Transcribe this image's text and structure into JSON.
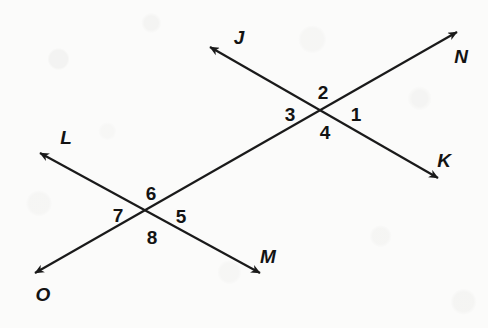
{
  "figure": {
    "type": "geometry-diagram",
    "canvas": {
      "width": 488,
      "height": 328
    },
    "background_color": "#fbfbfa",
    "stroke_color": "#1a1a1a",
    "text_color": "#131313",
    "lines": [
      {
        "name": "transversal-ON",
        "from_label": "O",
        "to_label": "N",
        "x1": 35,
        "y1": 273,
        "x2": 457,
        "y2": 32,
        "arrow_start": true,
        "arrow_end": true
      },
      {
        "name": "line-JK",
        "from_label": "J",
        "to_label": "K",
        "x1": 210,
        "y1": 47,
        "x2": 438,
        "y2": 178,
        "arrow_start": true,
        "arrow_end": true
      },
      {
        "name": "line-LM",
        "from_label": "L",
        "to_label": "M",
        "x1": 40,
        "y1": 153,
        "x2": 260,
        "y2": 273,
        "arrow_start": true,
        "arrow_end": true
      }
    ],
    "intersections": [
      {
        "name": "upper-intersection",
        "x": 322,
        "y": 113,
        "angles": [
          "1",
          "2",
          "3",
          "4"
        ]
      },
      {
        "name": "lower-intersection",
        "x": 150,
        "y": 215,
        "angles": [
          "5",
          "6",
          "7",
          "8"
        ]
      }
    ],
    "point_labels": [
      {
        "id": "J",
        "text": "J",
        "x": 239,
        "y": 37
      },
      {
        "id": "N",
        "text": "N",
        "x": 461,
        "y": 56
      },
      {
        "id": "K",
        "text": "K",
        "x": 444,
        "y": 160
      },
      {
        "id": "L",
        "text": "L",
        "x": 66,
        "y": 137
      },
      {
        "id": "M",
        "text": "M",
        "x": 268,
        "y": 256
      },
      {
        "id": "O",
        "text": "O",
        "x": 43,
        "y": 294
      }
    ],
    "angle_labels": [
      {
        "id": "angle-1",
        "text": "1",
        "x": 356,
        "y": 114
      },
      {
        "id": "angle-2",
        "text": "2",
        "x": 323,
        "y": 92
      },
      {
        "id": "angle-3",
        "text": "3",
        "x": 290,
        "y": 114
      },
      {
        "id": "angle-4",
        "text": "4",
        "x": 325,
        "y": 132
      },
      {
        "id": "angle-5",
        "text": "5",
        "x": 181,
        "y": 216
      },
      {
        "id": "angle-6",
        "text": "6",
        "x": 151,
        "y": 193
      },
      {
        "id": "angle-7",
        "text": "7",
        "x": 118,
        "y": 215
      },
      {
        "id": "angle-8",
        "text": "8",
        "x": 152,
        "y": 237
      }
    ]
  }
}
